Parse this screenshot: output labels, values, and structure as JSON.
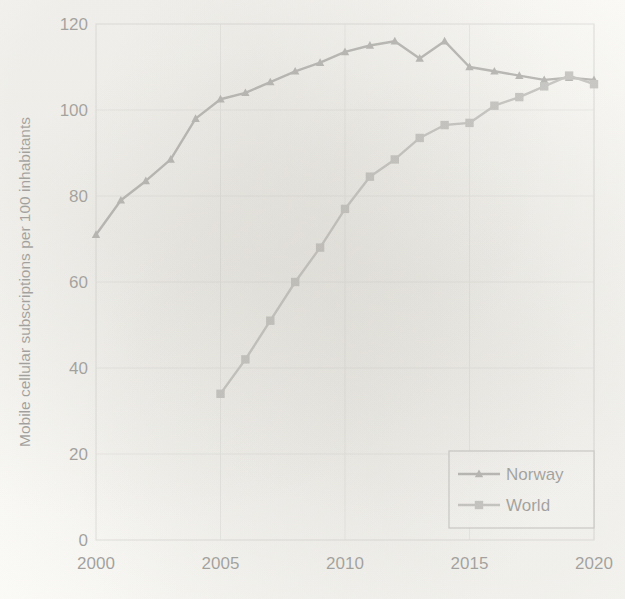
{
  "chart_data": {
    "type": "line",
    "title": "",
    "xlabel": "",
    "ylabel": "Mobile cellular subscriptions per 100 inhabitants",
    "x": [
      2000,
      2001,
      2002,
      2003,
      2004,
      2005,
      2006,
      2007,
      2008,
      2009,
      2010,
      2011,
      2012,
      2013,
      2014,
      2015,
      2016,
      2017,
      2018,
      2019,
      2020
    ],
    "xlim": [
      2000,
      2020
    ],
    "ylim": [
      0,
      120
    ],
    "xticks": [
      2000,
      2005,
      2010,
      2015,
      2020
    ],
    "yticks": [
      0,
      20,
      40,
      60,
      80,
      100,
      120
    ],
    "xtick_labels": [
      "2000",
      "2005",
      "2010",
      "2015",
      "2020"
    ],
    "ytick_labels": [
      "0",
      "20",
      "40",
      "60",
      "80",
      "100",
      "120"
    ],
    "grid": true,
    "grid_axis": "both",
    "legend_position": "lower-right",
    "series": [
      {
        "name": "Norway",
        "marker": "triangle",
        "color": "#595959",
        "x": [
          2000,
          2001,
          2002,
          2003,
          2004,
          2005,
          2006,
          2007,
          2008,
          2009,
          2010,
          2011,
          2012,
          2013,
          2014,
          2015,
          2016,
          2017,
          2018,
          2019,
          2020
        ],
        "values": [
          71,
          79,
          83.5,
          88.5,
          98,
          102.5,
          104,
          106.5,
          109,
          111,
          113.5,
          115,
          116,
          112,
          116,
          110,
          109,
          108,
          107,
          107.5,
          107
        ]
      },
      {
        "name": "World",
        "marker": "square",
        "color": "#808080",
        "x": [
          2005,
          2006,
          2007,
          2008,
          2009,
          2010,
          2011,
          2012,
          2013,
          2014,
          2015,
          2016,
          2017,
          2018,
          2019,
          2020
        ],
        "values": [
          34,
          42,
          51,
          60,
          68,
          77,
          84.5,
          88.5,
          93.5,
          96.5,
          97,
          101,
          103,
          105.5,
          108,
          106
        ]
      }
    ]
  },
  "axis": {
    "y_title": "Mobile cellular subscriptions per 100 inhabitants"
  },
  "legend": {
    "entries": [
      {
        "label": "Norway"
      },
      {
        "label": "World"
      }
    ]
  },
  "colors": {
    "norway": "#595959",
    "world": "#808080",
    "grid": "#d9d9d9",
    "plot_border": "#c9c9c9",
    "text": "#1a1a1a",
    "background": "#fdfdfb"
  }
}
